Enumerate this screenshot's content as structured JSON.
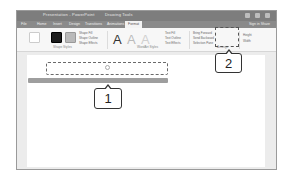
{
  "window": {
    "title": "Presentation - PowerPoint",
    "title_extra": "Drawing Tools",
    "controls": [
      "minimize-icon",
      "maximize-icon",
      "close-icon"
    ]
  },
  "tabs": [
    {
      "label": "File"
    },
    {
      "label": "Home"
    },
    {
      "label": "Insert"
    },
    {
      "label": "Design"
    },
    {
      "label": "Transitions"
    },
    {
      "label": "Animations"
    },
    {
      "label": "Format",
      "active": true
    }
  ],
  "tab_right": "Sign in  Share",
  "ribbon": {
    "groups": [
      {
        "name": "Shape Styles",
        "options": [
          "Shape Fill",
          "Shape Outline",
          "Shape Effects"
        ]
      },
      {
        "name": "WordArt Styles",
        "options": [
          "Text Fill",
          "Text Outline",
          "Text Effects"
        ]
      },
      {
        "name": "Arrange",
        "options": [
          "Bring Forward",
          "Send Backward",
          "Selection Pane"
        ]
      },
      {
        "name": "Size",
        "options": [
          "Height",
          "Width"
        ]
      }
    ],
    "wordart_glyph": "A"
  },
  "callouts": [
    {
      "number": "1"
    },
    {
      "number": "2"
    }
  ]
}
